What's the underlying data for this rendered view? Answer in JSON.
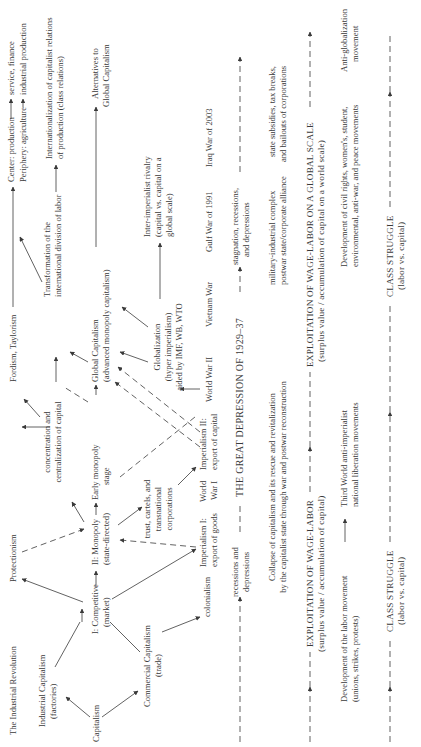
{
  "diagram": {
    "row1": {
      "industrial_revolution": "The Industrial Revolution",
      "protectionism": "Protectionism",
      "fordism": "Fordism, Taylorism",
      "center_line": "Center: production",
      "center_target": "service, finance",
      "periphery_line": "Periphery: agriculture",
      "periphery_target": "industrial production"
    },
    "row2": {
      "industrial_capitalism": [
        "Industrial Capitalism",
        "(factories)"
      ],
      "concentration": [
        "concentration and",
        "centralization of capital"
      ],
      "transformation": [
        "Transformation of the",
        "international division of labor"
      ],
      "internationalization": [
        "Internationalization of capitalist relations",
        "of production (class relations)"
      ]
    },
    "row3": {
      "capitalism": "Capitalism",
      "competitive": [
        "I: Competitive",
        "(market)"
      ],
      "monopoly": [
        "II: Monopoly",
        "(state-directed)"
      ],
      "early_monopoly": [
        "Early monopoly",
        "stage"
      ],
      "global_capitalism": [
        "Global Capitalism",
        "(advanced monopoly capitalism)"
      ],
      "alternatives": [
        "Alternatives to",
        "Global Capitalism"
      ]
    },
    "row4": {
      "commercial_capitalism": [
        "Commercial Capitalism",
        "(trade)"
      ],
      "trusts": [
        "trust, cartels, and",
        "transnational",
        "corporations"
      ],
      "globalization": [
        "Globalization",
        "(hyper imperialism)",
        "aided by IMF, WB, WTO"
      ],
      "inter_imperialist": [
        "Inter-imperialist rivalry",
        "(capital vs. capital on a",
        "global scale)"
      ]
    },
    "row5": {
      "colonialism": "colonialism",
      "imperialism1": [
        "Imperialism I:",
        "export of goods"
      ],
      "ww1": [
        "World",
        "War I"
      ],
      "imperialism2": [
        "Imperialism II:",
        "export of capital"
      ],
      "ww2": "World War II",
      "vietnam": "Vietnam War",
      "gulf": "Gulf War of 1991",
      "iraq": "Iraq War of 2003"
    },
    "crisis": {
      "recessions": [
        "recessions and",
        "depressions"
      ],
      "great_depression": "THE GREAT DEPRESSION OF 1929–37",
      "stagnation": [
        "stagnation, recessions,",
        "and depressions"
      ]
    },
    "state": {
      "collapse": [
        "Collapse of capitalism and its rescue and revitalization",
        "by the capitalist state through war and postwar reconstruction"
      ],
      "military": [
        "military-industrial complex",
        "postwar state/corporate alliance"
      ],
      "subsidies": [
        "state subsidies, tax breaks,",
        "and bailouts of corporations"
      ]
    },
    "exploitation": {
      "wage_labor": [
        "EXPLOITATION OF WAGE-LABOR",
        "(surplus value / accumulation of capital)"
      ],
      "global_scale": [
        "EXPLOITATION OF WAGE-LABOR ON A GLOBAL SCALE",
        "(surplus value / accumulation of capital on a world scale)"
      ]
    },
    "movements": {
      "labor": [
        "Development of the labor movement",
        "(unions, strikes, protests)"
      ],
      "third_world": [
        "Third World anti-imperialist",
        "national liberation movements"
      ],
      "civil_rights": [
        "Development of civil rights, women's, student,",
        "environmental, anti-war, and peace movements"
      ],
      "anti_globalization": [
        "Anti-globalization",
        "movement"
      ]
    },
    "class_struggle": {
      "first": [
        "CLASS STRUGGLE",
        "(labor vs. capital)"
      ],
      "second": [
        "CLASS STRUGGLE",
        "(labor vs. capital)"
      ]
    }
  }
}
